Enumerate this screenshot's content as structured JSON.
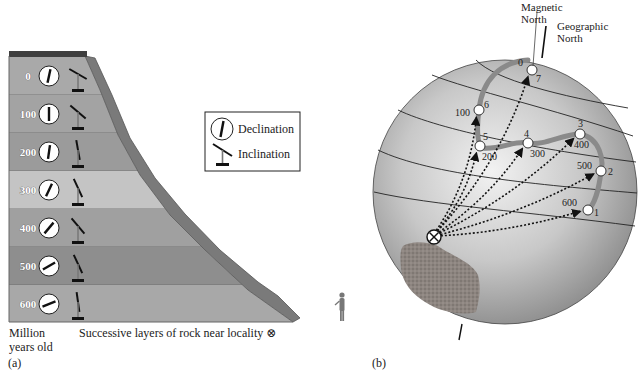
{
  "panel_a": {
    "label": "(a)",
    "axis_label_line1": "Million",
    "axis_label_line2": "years old",
    "caption": "Successive layers of rock near locality ⊗",
    "legend": {
      "declination": "Declination",
      "inclination": "Inclination"
    },
    "layers": [
      {
        "age": "0",
        "color": "#a9a9a9",
        "declination_deg": 12,
        "inclination_deg": -30
      },
      {
        "age": "100",
        "color": "#a3a3a3",
        "declination_deg": 0,
        "inclination_deg": -40
      },
      {
        "age": "200",
        "color": "#9b9b9b",
        "declination_deg": 8,
        "inclination_deg": -80
      },
      {
        "age": "300",
        "color": "#c4c4c4",
        "declination_deg": 25,
        "inclination_deg": -65
      },
      {
        "age": "400",
        "color": "#a0a0a0",
        "declination_deg": 40,
        "inclination_deg": -50
      },
      {
        "age": "500",
        "color": "#8e8e8e",
        "declination_deg": 60,
        "inclination_deg": -65
      },
      {
        "age": "600",
        "color": "#a8a8a8",
        "declination_deg": 68,
        "inclination_deg": -82
      }
    ]
  },
  "panel_b": {
    "label": "(b)",
    "magnetic_north": [
      "Magnetic",
      "North"
    ],
    "geographic_north": [
      "Geographic",
      "North"
    ],
    "locality_symbol": "⊗",
    "pole_path_points": [
      {
        "id": "7",
        "age": "0",
        "x": 532,
        "y": 70
      },
      {
        "id": "6",
        "age": "100",
        "x": 479,
        "y": 110
      },
      {
        "id": "5",
        "age": "200",
        "x": 480,
        "y": 146
      },
      {
        "id": "4",
        "age": "300",
        "x": 528,
        "y": 143
      },
      {
        "id": "3",
        "age": "400",
        "x": 580,
        "y": 134
      },
      {
        "id": "2",
        "age": "500",
        "x": 601,
        "y": 171
      },
      {
        "id": "1",
        "age": "600",
        "x": 588,
        "y": 210
      }
    ]
  }
}
